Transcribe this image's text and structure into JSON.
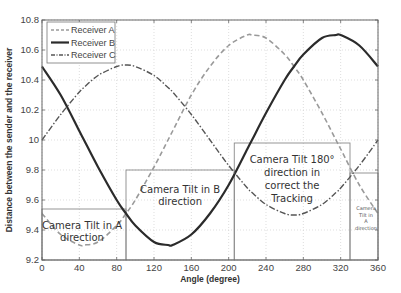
{
  "chart_data": {
    "type": "line",
    "title": "",
    "xlabel": "Angle (degree)",
    "ylabel": "Distance between the sender and the receiver",
    "xlim": [
      0,
      360
    ],
    "ylim": [
      9.2,
      10.8
    ],
    "xticks": [
      0,
      40,
      80,
      120,
      160,
      200,
      240,
      280,
      320,
      360
    ],
    "yticks": [
      9.2,
      9.4,
      9.6,
      9.8,
      10,
      10.2,
      10.4,
      10.6,
      10.8
    ],
    "ytick_labels": [
      "9.2",
      "9.4",
      "9.6",
      "9.8",
      "10",
      "10.2",
      "10.4",
      "10.6",
      "10.8"
    ],
    "grid": true,
    "legend_position": "upper-left",
    "x": [
      0,
      20,
      40,
      45,
      60,
      80,
      90,
      100,
      120,
      135,
      140,
      160,
      180,
      200,
      220,
      225,
      240,
      260,
      270,
      280,
      300,
      315,
      320,
      340,
      360
    ],
    "series": [
      {
        "name": "Receiver A",
        "style": "dashed",
        "color": "#9a9a9a",
        "values": [
          9.51,
          9.37,
          9.3,
          9.3,
          9.32,
          9.43,
          9.51,
          9.6,
          9.82,
          10.0,
          10.06,
          10.3,
          10.49,
          10.63,
          10.7,
          10.7,
          10.68,
          10.57,
          10.49,
          10.4,
          10.18,
          10.0,
          9.94,
          9.7,
          9.51
        ]
      },
      {
        "name": "Receiver B",
        "style": "solid",
        "color": "#2b2b2b",
        "values": [
          10.49,
          10.3,
          10.06,
          10.0,
          9.82,
          9.6,
          9.51,
          9.43,
          9.32,
          9.3,
          9.3,
          9.37,
          9.51,
          9.7,
          9.94,
          10.0,
          10.18,
          10.4,
          10.49,
          10.57,
          10.68,
          10.7,
          10.7,
          10.63,
          10.49
        ]
      },
      {
        "name": "Receiver C",
        "style": "dash-dot",
        "color": "#555555",
        "values": [
          10.0,
          10.17,
          10.32,
          10.35,
          10.43,
          10.49,
          10.5,
          10.49,
          10.43,
          10.35,
          10.32,
          10.17,
          10.0,
          9.83,
          9.68,
          9.65,
          9.57,
          9.51,
          9.5,
          9.51,
          9.57,
          9.65,
          9.68,
          9.83,
          10.0
        ]
      }
    ],
    "annotations": [
      {
        "text": [
          "Camera Tilt in A",
          "direction"
        ],
        "box": {
          "x0": 0,
          "x1": 90,
          "y_top": 9.54,
          "y_bottom": 9.2
        }
      },
      {
        "text": [
          "Camera Tilt in B",
          "direction"
        ],
        "box": {
          "x0": 90,
          "x1": 206,
          "y_top": 9.8,
          "y_bottom": 9.2
        }
      },
      {
        "text": [
          "Camera Tilt 180°",
          "direction in",
          "correct the",
          "Tracking"
        ],
        "box": {
          "x0": 206,
          "x1": 330,
          "y_top": 9.98,
          "y_bottom": 9.2
        }
      },
      {
        "text": [
          "Camera",
          "Tilt in",
          "A",
          "direction"
        ],
        "box": {
          "x0": 330,
          "x1": 360,
          "y_top": 9.78,
          "y_bottom": 9.2
        }
      }
    ]
  }
}
